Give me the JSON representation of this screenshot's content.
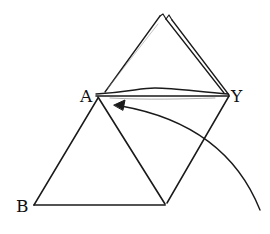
{
  "diagram": {
    "type": "folded-triangles-sketch",
    "labels": {
      "A": "A",
      "B": "B",
      "Y": "Y"
    },
    "stroke_color": "#1a1a1a",
    "background": "#ffffff"
  }
}
